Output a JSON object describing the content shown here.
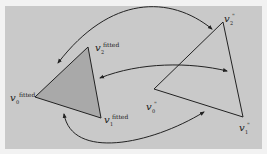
{
  "diagram": {
    "colors": {
      "background": "#c9c9c9",
      "page": "#f2f2f2",
      "fitted_fill": "#a9a9a9",
      "stroke": "#222222"
    },
    "fitted_triangle": {
      "vertices": [
        {
          "base": "v",
          "sub": "0",
          "sup": "fitted"
        },
        {
          "base": "v",
          "sub": "1",
          "sup": "fitted"
        },
        {
          "base": "v",
          "sub": "2",
          "sup": "fitted"
        }
      ]
    },
    "target_triangle": {
      "vertices": [
        {
          "base": "v",
          "sub": "0",
          "sup": "\""
        },
        {
          "base": "v",
          "sub": "1",
          "sup": "\""
        },
        {
          "base": "v",
          "sub": "2",
          "sup": "\""
        }
      ]
    },
    "correspondence_arrows": [
      {
        "from": "v2\"",
        "to": "v2fitted",
        "bidirectional": true
      },
      {
        "from": "v2fitted side",
        "to": "v2\" side",
        "bidirectional": true
      },
      {
        "from": "v1fitted",
        "to": "v0\"",
        "bidirectional": true
      }
    ]
  }
}
